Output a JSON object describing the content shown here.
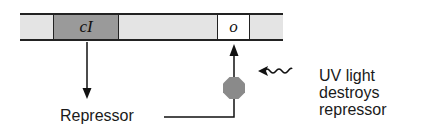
{
  "diagram": {
    "gene_bar": {
      "segments": [
        {
          "label": "cI",
          "fill": "#9a9a9a"
        },
        {
          "label": "o",
          "fill": "#ffffff"
        }
      ],
      "background_fill": "#e4e4e4"
    },
    "labels": {
      "repressor": "Repressor",
      "uv_light": "UV light destroys repressor"
    },
    "repressor_protein_color": "#8a8a8a",
    "uv_symbol": "wavy-arrow"
  }
}
